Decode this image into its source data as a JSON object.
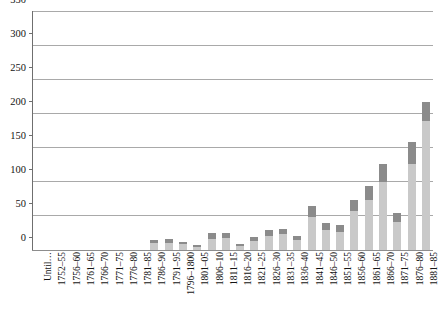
{
  "chart_data": {
    "type": "bar",
    "title": "",
    "subtitle": "",
    "xlabel": "",
    "ylabel": "",
    "ylim": [
      0,
      350
    ],
    "ytick_step": 50,
    "grid": true,
    "grid_axis": "y",
    "legend": null,
    "legend_position": "none",
    "stacked": true,
    "bar_colors": {
      "lower_segment": "#c9c9c9",
      "upper_segment": "#8b8b8b"
    },
    "yticks": [
      0,
      50,
      100,
      150,
      200,
      250,
      300,
      350
    ],
    "ytick_labels": [
      "0",
      "50",
      "100",
      "150",
      "200",
      "250",
      "300",
      "350"
    ],
    "categories": [
      "Until…",
      "1752–55",
      "1756–60",
      "1761–65",
      "1766–70",
      "1771–75",
      "1776–80",
      "1781–85",
      "1786–90",
      "1791–95",
      "1796–1800",
      "1801–05",
      "1806–10",
      "1811–15",
      "1816–20",
      "1821–25",
      "1826–30",
      "1831–35",
      "1836–40",
      "1841–45",
      "1846–50",
      "1851–55",
      "1856–60",
      "1861–65",
      "1866–70",
      "1871–75",
      "1876–80",
      "1881–85"
    ],
    "series": [
      {
        "name": "lower",
        "values": [
          0,
          0,
          0,
          0,
          0,
          0,
          0,
          0,
          10,
          11,
          9,
          4,
          16,
          18,
          6,
          13,
          20,
          23,
          15,
          48,
          30,
          27,
          57,
          73,
          100,
          41,
          127,
          190
        ]
      },
      {
        "name": "upper",
        "values": [
          0,
          0,
          0,
          0,
          0,
          0,
          0,
          0,
          4,
          5,
          3,
          3,
          9,
          7,
          3,
          6,
          9,
          8,
          6,
          17,
          10,
          10,
          17,
          21,
          26,
          14,
          32,
          28
        ]
      }
    ],
    "totals": [
      0,
      0,
      0,
      0,
      0,
      0,
      0,
      0,
      14,
      16,
      12,
      7,
      25,
      25,
      9,
      19,
      29,
      31,
      21,
      65,
      40,
      37,
      74,
      94,
      126,
      55,
      159,
      218
    ]
  }
}
